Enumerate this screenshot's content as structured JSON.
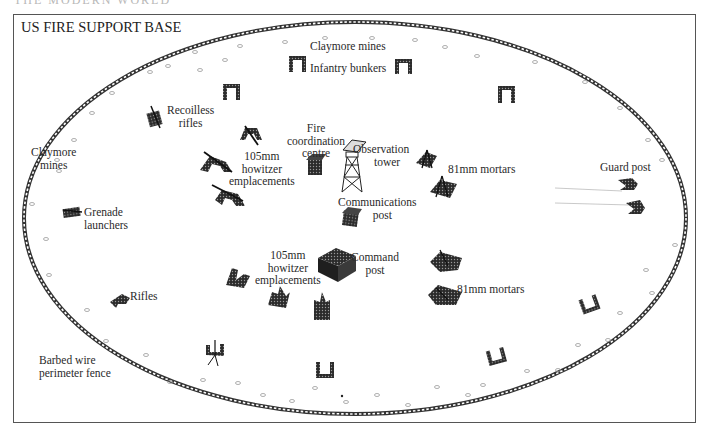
{
  "header": {
    "cut_off_text": "THE MODERN WORLD"
  },
  "diagram": {
    "title": "US FIRE SUPPORT BASE",
    "labels": {
      "claymore_top": "Claymore mines",
      "infantry_bunkers": "Infantry bunkers",
      "recoilless_rifles_1": "Recoilless",
      "recoilless_rifles_2": "rifles",
      "claymore_left_1": "Claymore",
      "claymore_left_2": "mines",
      "howitzer_top_1": "105mm",
      "howitzer_top_2": "howitzer",
      "howitzer_top_3": "emplacements",
      "fire_coord_1": "Fire",
      "fire_coord_2": "coordination",
      "fire_coord_3": "centre",
      "obs_tower_1": "Observation",
      "obs_tower_2": "tower",
      "mortars_top": "81mm mortars",
      "guard_post": "Guard post",
      "grenade_1": "Grenade",
      "grenade_2": "launchers",
      "comms_1": "Communications",
      "comms_2": "post",
      "howitzer_bottom_1": "105mm",
      "howitzer_bottom_2": "howitzer",
      "howitzer_bottom_3": "emplacements",
      "command_1": "Command",
      "command_2": "post",
      "mortars_bottom": "81mm mortars",
      "rifles": "Rifles",
      "barbed_1": "Barbed wire",
      "barbed_2": "perimeter fence"
    },
    "perimeter": {
      "shape": "ellipse",
      "cx": 355,
      "cy": 218,
      "rx": 331,
      "ry": 196,
      "fence_color": "#3a3a3a"
    },
    "icon_color": "#2b2b2b"
  }
}
